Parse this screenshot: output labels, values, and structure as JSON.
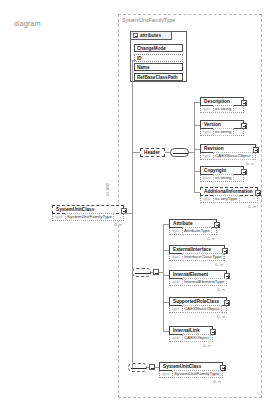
{
  "caption": "diagram",
  "type_container": {
    "title": "SystemUnitFamilyType"
  },
  "side_label": "xs:any",
  "attributes_panel": {
    "header_label": "attributes",
    "rows": [
      {
        "name": "ChangeMode"
      },
      {
        "name": "ID"
      },
      {
        "name": "Name"
      },
      {
        "name": "RefBaseClassPath"
      }
    ]
  },
  "root_element": {
    "name": "SystemUnitClass",
    "type_key": "type",
    "type_value": "SystemUnitFamilyType",
    "cardinality": "0..∞"
  },
  "header_group": {
    "label": "Header",
    "children": [
      {
        "name": "Description",
        "type_key": "type",
        "type_value": "xs:string",
        "cardinality": ""
      },
      {
        "name": "Version",
        "type_key": "type",
        "type_value": "xs:string",
        "cardinality": ""
      },
      {
        "name": "Revision",
        "type_key": "type",
        "type_value": "CAEXBasicObject",
        "cardinality": "0..∞"
      },
      {
        "name": "Copyright",
        "type_key": "type",
        "type_value": "xs:string",
        "cardinality": ""
      },
      {
        "name": "AdditionalInformation",
        "type_key": "type",
        "type_value": "xs:anyType",
        "cardinality": "0..∞"
      }
    ]
  },
  "content_group": {
    "children": [
      {
        "name": "Attribute",
        "type_key": "type",
        "type_value": "AttributeType",
        "cardinality": "0..∞"
      },
      {
        "name": "ExternalInterface",
        "type_key": "type",
        "type_value": "InterfaceClassType",
        "cardinality": "0..∞"
      },
      {
        "name": "InternalElement",
        "type_key": "type",
        "type_value": "InternalElementType",
        "cardinality": "0..∞"
      },
      {
        "name": "SupportedRoleClass",
        "type_key": "type",
        "type_value": "CAEXBasicObject",
        "cardinality": "0..∞"
      },
      {
        "name": "InternalLink",
        "type_key": "type",
        "type_value": "CAEXObject",
        "cardinality": "0..∞"
      }
    ]
  },
  "recursive_group": {
    "children": [
      {
        "name": "SystemUnitClass",
        "type_key": "type",
        "type_value": "SystemUnitFamilyType",
        "cardinality": "0..∞"
      }
    ]
  }
}
